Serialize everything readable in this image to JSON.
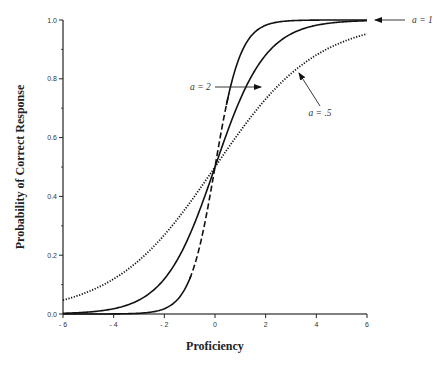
{
  "chart_data": {
    "type": "line",
    "title": "",
    "xlabel": "Proficiency",
    "ylabel": "Probability of Correct Response",
    "xlim": [
      -6,
      6
    ],
    "ylim": [
      0,
      1
    ],
    "grid": false,
    "legend": "none (inline arrow annotations)",
    "x_ticks": [
      -6,
      -4,
      -2,
      0,
      2,
      4,
      6
    ],
    "x_tick_labels": [
      "- 6",
      "- 4",
      "- 2",
      "0",
      "2",
      "4",
      "6"
    ],
    "y_ticks": [
      0.0,
      0.2,
      0.4,
      0.6,
      0.8,
      1.0
    ],
    "y_tick_labels": [
      "0.0",
      "0.2",
      "0.4",
      "0.6",
      "0.8",
      "1.0"
    ],
    "x": [
      -6,
      -5,
      -4,
      -3,
      -2,
      -1,
      0,
      1,
      2,
      3,
      4,
      5,
      6
    ],
    "series": [
      {
        "name": "a = 1",
        "style": "solid",
        "values": [
          0.002,
          0.007,
          0.018,
          0.047,
          0.119,
          0.269,
          0.5,
          0.731,
          0.881,
          0.953,
          0.982,
          0.993,
          0.998
        ]
      },
      {
        "name": "a = 2",
        "style": "solid upper / dashed lower",
        "values": [
          0.0,
          0.0,
          0.0,
          0.002,
          0.018,
          0.119,
          0.5,
          0.881,
          0.982,
          0.998,
          1.0,
          1.0,
          1.0
        ]
      },
      {
        "name": "a = .5",
        "style": "dotted",
        "values": [
          0.047,
          0.076,
          0.119,
          0.182,
          0.269,
          0.378,
          0.5,
          0.622,
          0.731,
          0.818,
          0.881,
          0.924,
          0.953
        ]
      }
    ],
    "annotations": [
      {
        "text": "a = 1",
        "points_to": "a = 1 curve near x=6, y=1.0"
      },
      {
        "text": "a = 2",
        "points_to": "a = 2 curve near x=0.6, y=0.84"
      },
      {
        "text": "a = .5",
        "points_to": "a = .5 curve near x=3.2, y=0.78"
      }
    ]
  }
}
